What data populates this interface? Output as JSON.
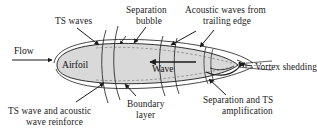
{
  "figure": {
    "type": "technical-diagram",
    "background_color": "#ffffff",
    "line_color": "#1a1a1a",
    "body_fill_color": "#d9d9d9"
  },
  "labels": {
    "flow": "Flow",
    "airfoil": "Airfoil",
    "wave": "Wave",
    "ts_waves": "TS waves",
    "separation_bubble_line1": "Separation",
    "separation_bubble_line2": "bubble",
    "acoustic_waves_line1": "Acoustic waves from",
    "acoustic_waves_line2": "trailing edge",
    "vortex_shedding": "Vortex shedding",
    "separation_ts_line1": "Separation and TS",
    "separation_ts_line2": "amplification",
    "boundary_layer_line1": "Boundary",
    "boundary_layer_line2": "layer",
    "ts_reinforce_line1": "TS wave and acoustic",
    "ts_reinforce_line2": "wave reinforce"
  },
  "annotations": {
    "leader_count": 9,
    "flow_direction": "left-to-right",
    "wave_arrow_direction": "right-to-left"
  }
}
